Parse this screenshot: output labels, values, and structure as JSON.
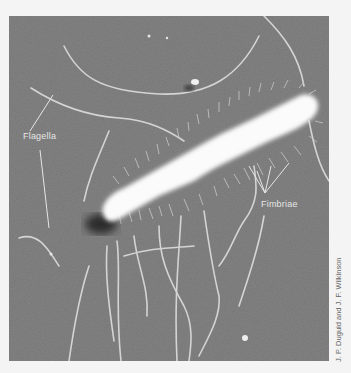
{
  "figure": {
    "labels": {
      "flagella": "Flagella",
      "fimbriae": "Fimbriae"
    },
    "credit": "J. P. Duguid and J. F. Wilkinson",
    "colors": {
      "background": "#7d7d7d",
      "cell_body": "#fbfbfb",
      "flagella": "#d0d0d0",
      "page": "#f4f4f4"
    }
  }
}
